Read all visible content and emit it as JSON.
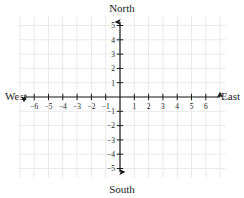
{
  "chart_data": {
    "type": "scatter",
    "title": "",
    "subtitle": "",
    "xlabel": "",
    "ylabel": "",
    "xlim": [
      -6.8,
      6.8
    ],
    "ylim": [
      -5.8,
      5.8
    ],
    "grid": true,
    "grid_color": "#e8e8e8",
    "axis_color": "#1c1c1c",
    "legend": "none",
    "x_ticks": [
      -6,
      -5,
      -4,
      -3,
      -2,
      -1,
      1,
      2,
      3,
      4,
      5,
      6
    ],
    "y_ticks": [
      5,
      4,
      3,
      2,
      1,
      -1,
      -2,
      -3,
      -4,
      -5
    ],
    "x_tick_labels": [
      "−6",
      "−5",
      "−4",
      "−3",
      "−2",
      "−1",
      "1",
      "2",
      "3",
      "4",
      "5",
      "6"
    ],
    "y_tick_labels": [
      "5",
      "4",
      "3",
      "2",
      "1",
      "−1",
      "−2",
      "−3",
      "−4",
      "−5"
    ],
    "series": [
      {
        "name": "points",
        "x": [],
        "y": []
      }
    ],
    "annotations": []
  },
  "compass": {
    "north": "North",
    "south": "South",
    "west": "West",
    "east": "East"
  },
  "axes": {
    "vertical_axis_name": "north-south-axis",
    "horizontal_axis_name": "west-east-axis",
    "origin_label": ""
  }
}
